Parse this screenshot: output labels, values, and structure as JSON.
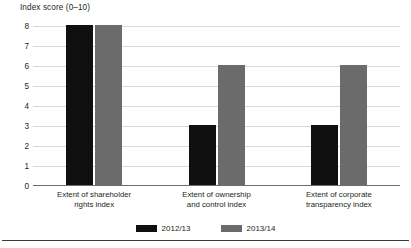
{
  "chart_data": {
    "type": "bar",
    "title": "",
    "subtitle": "",
    "xlabel": "",
    "ylabel": "Index score (0–10)",
    "ylim": [
      0,
      8
    ],
    "ytick_step": 1,
    "yticks": [
      "8",
      "7",
      "6",
      "5",
      "4",
      "3",
      "2",
      "1",
      "0"
    ],
    "grid": true,
    "legend_position": "bottom-center",
    "categories": [
      "Extent of shareholder\nrights index",
      "Extent of ownership\nand control index",
      "Extent of corporate\ntransparency index"
    ],
    "category_lines": [
      [
        "Extent of shareholder",
        "rights index"
      ],
      [
        "Extent of ownership",
        "and control index"
      ],
      [
        "Extent of corporate",
        "transparency index"
      ]
    ],
    "series": [
      {
        "name": "2012/13",
        "color": "#0f0f0f",
        "values": [
          8,
          3,
          3
        ]
      },
      {
        "name": "2013/14",
        "color": "#6b6b6b",
        "values": [
          8,
          6,
          6
        ]
      }
    ]
  },
  "legend": {
    "items": [
      {
        "label": "2012/13",
        "color": "#0f0f0f"
      },
      {
        "label": "2013/14",
        "color": "#6b6b6b"
      }
    ]
  },
  "colors": {
    "series_2012_13": "#0f0f0f",
    "series_2013_14": "#6b6b6b",
    "gridline": "#d8d8d8",
    "axis": "#6e6e6e",
    "text": "#231f20",
    "rule": "#3a3a3a",
    "background": "#ffffff"
  }
}
